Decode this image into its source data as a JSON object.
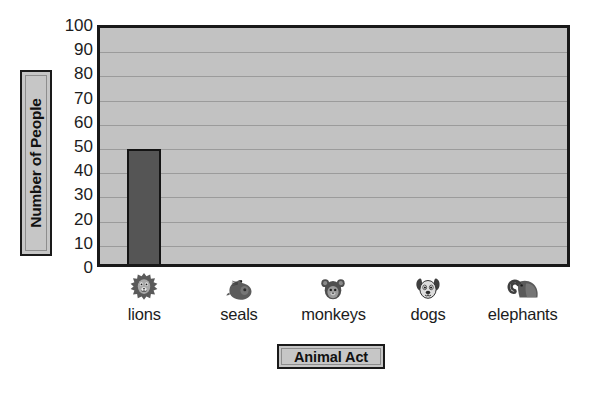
{
  "chart_data": {
    "type": "bar",
    "title": "",
    "xlabel": "Animal Act",
    "ylabel": "Number of People",
    "categories": [
      "lions",
      "seals",
      "monkeys",
      "dogs",
      "elephants"
    ],
    "values": [
      50,
      0,
      0,
      0,
      0
    ],
    "ylim": [
      0,
      100
    ],
    "ytick_step": 10,
    "yticks": [
      "0",
      "10",
      "20",
      "30",
      "40",
      "50",
      "60",
      "70",
      "80",
      "90",
      "100"
    ],
    "grid": true,
    "legend": false,
    "category_icons": [
      "lion-icon",
      "seal-icon",
      "monkey-icon",
      "dog-icon",
      "elephant-icon"
    ],
    "colors": {
      "bar_fill": "#555555",
      "bar_outline": "#141414",
      "plot_background": "#c2c2c2",
      "plot_border": "#191919",
      "gridline": "#9b9b9b",
      "label_box_fill": "#c6c6c6",
      "label_box_border": "#1a1a1a",
      "text": "#1c1c1c",
      "page_background": "#ffffff"
    }
  }
}
